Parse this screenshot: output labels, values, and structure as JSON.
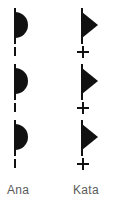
{
  "figure": {
    "background_color": "#ffffff",
    "ink_color": "#111111",
    "label_color": "#5a5a5a"
  },
  "columns": [
    {
      "id": "ana",
      "label": "Ana",
      "mark_glyph": "half-disc",
      "separator_glyph": "dash",
      "unit_count": 3,
      "separator_count": 3,
      "units": [
        {
          "index": 1,
          "mark": "half-disc",
          "separator_below": "dash"
        },
        {
          "index": 2,
          "mark": "half-disc",
          "separator_below": "dash"
        },
        {
          "index": 3,
          "mark": "half-disc",
          "separator_below": "dash"
        }
      ]
    },
    {
      "id": "kata",
      "label": "Kata",
      "mark_glyph": "triangle",
      "separator_glyph": "plus",
      "unit_count": 3,
      "separator_count": 3,
      "units": [
        {
          "index": 1,
          "mark": "triangle",
          "separator_below": "plus"
        },
        {
          "index": 2,
          "mark": "triangle",
          "separator_below": "plus"
        },
        {
          "index": 3,
          "mark": "triangle",
          "separator_below": "plus"
        }
      ]
    }
  ],
  "labels": {
    "ana": "Ana",
    "kata": "Kata"
  }
}
